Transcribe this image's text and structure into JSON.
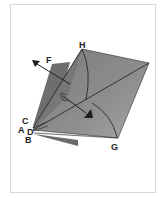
{
  "diagram": {
    "type": "origami-fold-step",
    "labels": {
      "H": "H",
      "F": "F",
      "C": "C",
      "A": "A",
      "D": "D",
      "B": "B",
      "G": "G"
    },
    "colors": {
      "background": "#ffffff",
      "frame": "#d8d8d8",
      "paper_dark": "#6e6e6e",
      "paper_mid": "#8a8a8a",
      "paper_light": "#a8a8a8",
      "paper_white": "#f2f2f2",
      "line": "#1e1e1e"
    },
    "arrows": [
      {
        "name": "unfold-arrow",
        "direction": "up-left",
        "near": "F"
      },
      {
        "name": "fold-arrow",
        "direction": "down-right",
        "toward": "G"
      }
    ]
  }
}
